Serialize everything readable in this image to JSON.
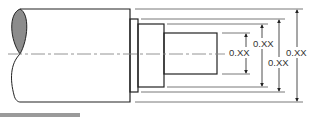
{
  "figure": {
    "type": "stepped shaft technical drawing",
    "colors": {
      "outline": "#222222",
      "extension_line": "#555555",
      "centerline": "#888888",
      "break_fill": "#8c8c8c",
      "bottom_bar": "#9a9a9a"
    }
  },
  "dimensions": [
    {
      "label": "0.XX",
      "feature": "pin diameter (smallest)"
    },
    {
      "label": "0.XX",
      "feature": "step diameter"
    },
    {
      "label": "0.XX",
      "feature": "collar diameter"
    },
    {
      "label": "0.XX",
      "feature": "shaft diameter (largest)"
    }
  ]
}
